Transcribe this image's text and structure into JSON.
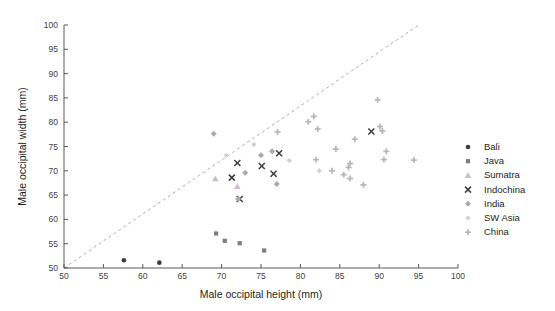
{
  "chart_data": {
    "type": "scatter",
    "title": "",
    "xlabel": "Male occipital height (mm)",
    "ylabel": "Male occipital width (mm)",
    "xlim": [
      50,
      100
    ],
    "ylim": [
      50,
      100
    ],
    "xticks": [
      50,
      55,
      60,
      65,
      70,
      75,
      80,
      85,
      90,
      95,
      100
    ],
    "yticks": [
      50,
      55,
      60,
      65,
      70,
      75,
      80,
      85,
      90,
      95,
      100
    ],
    "grid": false,
    "legend_position": "right",
    "annotations": [
      {
        "kind": "reference-line",
        "label": "identity line (y = x)",
        "from": [
          50,
          50
        ],
        "to": [
          95,
          100
        ],
        "style": "dashed"
      }
    ],
    "series": [
      {
        "name": "Bali",
        "marker": "circle",
        "color": "#3b3b44",
        "points": [
          [
            57.6,
            51.6
          ],
          [
            62.1,
            51.1
          ]
        ]
      },
      {
        "name": "Java",
        "marker": "square",
        "color": "#7c7c86",
        "points": [
          [
            69.3,
            57.1
          ],
          [
            70.4,
            55.6
          ],
          [
            72.3,
            55.1
          ],
          [
            75.4,
            53.6
          ]
        ]
      },
      {
        "name": "Sumatra",
        "marker": "triangle",
        "color": "#cdb9cf",
        "points": [
          [
            69.2,
            68.4
          ],
          [
            72.0,
            66.8
          ]
        ]
      },
      {
        "name": "Indochina",
        "marker": "x",
        "color": "#3b3b44",
        "points": [
          [
            72.0,
            71.6
          ],
          [
            71.3,
            68.6
          ],
          [
            72.3,
            64.2
          ],
          [
            75.1,
            71.0
          ],
          [
            77.3,
            73.6
          ],
          [
            76.6,
            69.4
          ],
          [
            89.0,
            78.1
          ]
        ]
      },
      {
        "name": "India",
        "marker": "diamond",
        "color": "#a9a9b4",
        "points": [
          [
            69.0,
            77.6
          ],
          [
            72.1,
            64.2
          ],
          [
            73.0,
            69.6
          ],
          [
            75.0,
            73.2
          ],
          [
            76.4,
            74.0
          ],
          [
            77.0,
            67.3
          ]
        ]
      },
      {
        "name": "SW Asia",
        "marker": "small-diamond",
        "color": "#cfcfd6",
        "points": [
          [
            70.6,
            73.2
          ],
          [
            74.1,
            75.4
          ],
          [
            78.6,
            72.1
          ],
          [
            82.4,
            70.0
          ]
        ]
      },
      {
        "name": "China",
        "marker": "plus",
        "color": "#b5b5bd",
        "points": [
          [
            77.1,
            78.0
          ],
          [
            81.0,
            80.1
          ],
          [
            81.7,
            81.2
          ],
          [
            82.2,
            78.6
          ],
          [
            82.0,
            72.3
          ],
          [
            84.0,
            70.0
          ],
          [
            84.5,
            74.5
          ],
          [
            85.5,
            69.2
          ],
          [
            86.1,
            70.7
          ],
          [
            86.3,
            71.5
          ],
          [
            86.3,
            68.4
          ],
          [
            86.9,
            76.5
          ],
          [
            88.0,
            67.1
          ],
          [
            89.8,
            84.6
          ],
          [
            90.1,
            79.1
          ],
          [
            90.4,
            78.2
          ],
          [
            90.6,
            72.3
          ],
          [
            90.9,
            74.0
          ],
          [
            94.4,
            72.2
          ]
        ]
      }
    ]
  },
  "legend": {
    "items": [
      {
        "label": "Bali"
      },
      {
        "label": "Java"
      },
      {
        "label": "Sumatra"
      },
      {
        "label": "Indochina"
      },
      {
        "label": "India"
      },
      {
        "label": "SW Asia"
      },
      {
        "label": "China"
      }
    ]
  }
}
